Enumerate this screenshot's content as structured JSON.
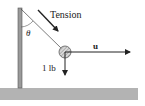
{
  "diagram": {
    "type": "physics-free-body",
    "labels": {
      "tension": "Tension",
      "theta": "θ",
      "weight": "1 lb",
      "u_vector": "u"
    },
    "elements": {
      "pole": "vertical-pole",
      "rope": "rope-to-ball",
      "ball": "hanging-ball",
      "ground": "ground-surface"
    },
    "colors": {
      "ink": "#222222",
      "pole": "#9a9a9a",
      "ground": "#b3b3b3",
      "ball": "#d8d8d8"
    }
  }
}
